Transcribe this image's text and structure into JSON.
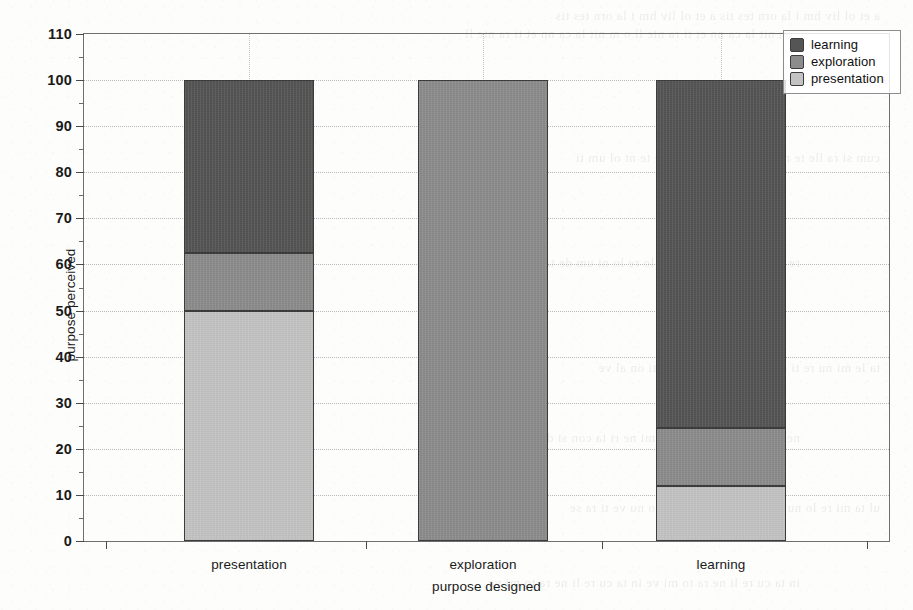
{
  "chart_data": {
    "type": "bar",
    "subtype": "stacked-bar-100-percent",
    "title": "",
    "subtitle": "",
    "xlabel": "purpose designed",
    "ylabel": "purpose perceived",
    "categories": [
      "presentation",
      "exploration",
      "learning"
    ],
    "series": [
      {
        "name": "presentation",
        "color": "#c3c3c3",
        "values": [
          50.0,
          0.0,
          12.0
        ]
      },
      {
        "name": "exploration",
        "color": "#8c8c8c",
        "values": [
          12.5,
          100.0,
          12.6
        ]
      },
      {
        "name": "learning",
        "color": "#555555",
        "values": [
          37.5,
          0.0,
          75.4
        ]
      }
    ],
    "stack_order_bottom_to_top": [
      "presentation",
      "exploration",
      "learning"
    ],
    "bar_totals": [
      100,
      100,
      100
    ],
    "ylim": [
      0,
      110
    ],
    "ytick_step": 10,
    "yminor_step": 5,
    "ytick_labels": [
      "0",
      "10",
      "20",
      "30",
      "40",
      "50",
      "60",
      "70",
      "80",
      "90",
      "100",
      "110"
    ],
    "ytick_values": [
      0,
      10,
      20,
      30,
      40,
      50,
      60,
      70,
      80,
      90,
      100,
      110
    ],
    "xtick_labels": [
      "presentation",
      "exploration",
      "learning"
    ],
    "grid": {
      "horizontal": true,
      "vertical": true,
      "style": "dotted"
    },
    "legend": {
      "position": "top-right",
      "entries": [
        {
          "label": "learning",
          "color": "#555555"
        },
        {
          "label": "exploration",
          "color": "#8c8c8c"
        },
        {
          "label": "presentation",
          "color": "#c3c3c3"
        }
      ]
    }
  },
  "axes": {
    "y_title": "purpose perceived",
    "x_title": "purpose designed"
  },
  "legend": {
    "entries": [
      {
        "label": "learning"
      },
      {
        "label": "exploration"
      },
      {
        "label": "presentation"
      }
    ]
  },
  "scan_artifacts": {
    "bleed_lines": [
      "a et  ol  liv  hm  i  la  orn  tes  tis",
      "o m  nit la  ca  nn  et  ti  ra  nte  ll",
      "cum  si  ra  lle  te  nt  ol  um  ti",
      "re  lo  ni  um  de  ta  ri  nu  se  lo",
      "ta  le  mi  nu  re  ti  on  al  ve",
      "ne  ri  ta  con  si  de  ra  te  lo  mi",
      "ul  ta  mi  re  lo  nu  ve  ti  ra  se",
      "in  ta  cu  re  li  ne  ra  to  mi  ve"
    ]
  }
}
